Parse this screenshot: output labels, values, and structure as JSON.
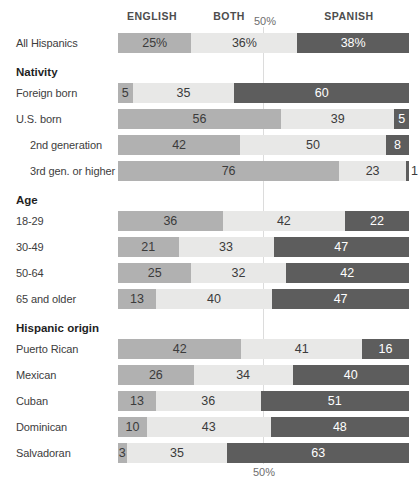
{
  "chart_data": {
    "type": "bar",
    "stacked": true,
    "orientation": "horizontal",
    "xlim": [
      0,
      100
    ],
    "columns": [
      "ENGLISH",
      "BOTH",
      "SPANISH"
    ],
    "gridline_label_top": "50%",
    "gridline_label_bottom": "50%",
    "colors": {
      "english": "#b1b1b1",
      "both": "#e8e8e7",
      "spanish": "#5d5d5d"
    },
    "gridline_color": "#dcdcdc",
    "rows": [
      {
        "type": "bar",
        "label": "All Hispanics",
        "values": [
          25,
          36,
          38
        ],
        "percent_suffix": true
      },
      {
        "type": "section",
        "label": "Nativity"
      },
      {
        "type": "bar",
        "label": "Foreign born",
        "values": [
          5,
          35,
          60
        ]
      },
      {
        "type": "bar",
        "label": "U.S. born",
        "values": [
          56,
          39,
          5
        ]
      },
      {
        "type": "bar",
        "label": "2nd generation",
        "values": [
          42,
          50,
          8
        ],
        "indent": true
      },
      {
        "type": "bar",
        "label": "3rd gen. or higher",
        "values": [
          76,
          23,
          1
        ],
        "indent": true,
        "last_label_outside": true
      },
      {
        "type": "section",
        "label": "Age"
      },
      {
        "type": "bar",
        "label": "18-29",
        "values": [
          36,
          42,
          22
        ]
      },
      {
        "type": "bar",
        "label": "30-49",
        "values": [
          21,
          33,
          47
        ]
      },
      {
        "type": "bar",
        "label": "50-64",
        "values": [
          25,
          32,
          42
        ]
      },
      {
        "type": "bar",
        "label": "65 and older",
        "values": [
          13,
          40,
          47
        ]
      },
      {
        "type": "section",
        "label": "Hispanic origin"
      },
      {
        "type": "bar",
        "label": "Puerto Rican",
        "values": [
          42,
          41,
          16
        ]
      },
      {
        "type": "bar",
        "label": "Mexican",
        "values": [
          26,
          34,
          40
        ]
      },
      {
        "type": "bar",
        "label": "Cuban",
        "values": [
          13,
          36,
          51
        ]
      },
      {
        "type": "bar",
        "label": "Dominican",
        "values": [
          10,
          43,
          48
        ]
      },
      {
        "type": "bar",
        "label": "Salvadoran",
        "values": [
          3,
          35,
          63
        ]
      }
    ]
  }
}
